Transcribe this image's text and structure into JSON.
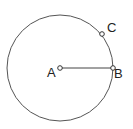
{
  "diagram": {
    "type": "geometry-circle",
    "circle": {
      "cx": 60,
      "cy": 68,
      "r": 53,
      "stroke": "#555555"
    },
    "segment": {
      "from": "A",
      "to": "B",
      "stroke": "#444444"
    },
    "points": [
      {
        "id": "A",
        "label": "A",
        "x": 60,
        "y": 68,
        "label_x": 47,
        "label_y": 77
      },
      {
        "id": "B",
        "label": "B",
        "x": 113,
        "y": 68,
        "label_x": 114,
        "label_y": 78
      },
      {
        "id": "C",
        "label": "C",
        "x": 102,
        "y": 34,
        "label_x": 107,
        "label_y": 32
      }
    ]
  }
}
